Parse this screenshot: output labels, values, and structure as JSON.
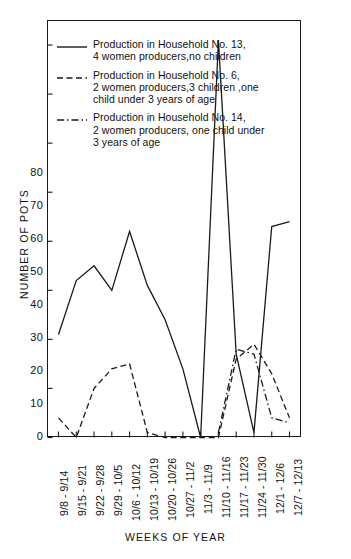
{
  "chart_data": {
    "type": "line",
    "title": "",
    "xlabel": "WEEKS OF YEAR",
    "ylabel": "NUMBER OF POTS",
    "ylim": [
      0,
      85
    ],
    "yticks": [
      0,
      10,
      20,
      30,
      40,
      50,
      60,
      70,
      80
    ],
    "ytick_labels": [
      "0",
      "10",
      "20",
      "30",
      "40",
      "50",
      "60",
      "70",
      "80"
    ],
    "grid": false,
    "legend_position": "upper-left-inside",
    "categories": [
      "9/8 - 9/14",
      "9/15 - 9/21",
      "9/22 - 9/28",
      "9/29 - 10/5",
      "10/6 - 10/12",
      "10/13 - 10/19",
      "10/20 - 10/26",
      "10/27 - 11/2",
      "11/3 - 11/9",
      "11/10 - 11/16",
      "11/17 - 11/23",
      "11/24 - 11/30",
      "12/1 - 12/6",
      "12/7 - 12/13"
    ],
    "series": [
      {
        "name": "Production in Household No. 13, 4 women producers, no children",
        "style": "solid",
        "values": [
          21,
          32,
          35,
          30,
          42,
          31,
          24,
          14,
          0,
          81,
          17,
          1,
          43,
          44
        ]
      },
      {
        "name": "Production in Household No. 6, 2 women producers, 3 children, one child under 3 years of age",
        "style": "dashed",
        "values": [
          4,
          0,
          10,
          14,
          15,
          1,
          0,
          0,
          0,
          0,
          16,
          19,
          13,
          4
        ]
      },
      {
        "name": "Production in Household No. 14, 2 women producers, one child under 3 years of age",
        "style": "dashdot",
        "values": [
          null,
          null,
          null,
          null,
          null,
          null,
          null,
          null,
          null,
          1,
          18,
          17,
          4,
          3
        ]
      }
    ]
  },
  "axes": {
    "y_title": "NUMBER OF POTS",
    "x_title": "WEEKS OF YEAR",
    "ytick_labels": [
      "80",
      "70",
      "60",
      "50",
      "40",
      "30",
      "20",
      "10",
      "0"
    ],
    "xtick_labels": [
      "9/8 - 9/14",
      "9/15 - 9/21",
      "9/22 - 9/28",
      "9/29 - 10/5",
      "10/6 - 10/12",
      "10/13 - 10/19",
      "10/20 - 10/26",
      "10/27 - 11/2",
      "11/3 - 11/9",
      "11/10 - 11/16",
      "11/17 - 11/23",
      "11/24 - 11/30",
      "12/1 - 12/6",
      "12/7 - 12/13"
    ]
  },
  "legend": {
    "entries": [
      {
        "style": "solid",
        "line1": "Production in Household No. 13,",
        "line2": "4 women producers,no children",
        "line3": ""
      },
      {
        "style": "dashed",
        "line1": "Production in Household No. 6,",
        "line2": "2 women producers,3 children ,one",
        "line3": "child under 3 years of age"
      },
      {
        "style": "dashdot",
        "line1": "Production in Household No. 14,",
        "line2": "2 women producers, one child under",
        "line3": "3 years of age"
      }
    ]
  },
  "colors": {
    "ink": "#1a1a1a",
    "background": "#ffffff"
  }
}
